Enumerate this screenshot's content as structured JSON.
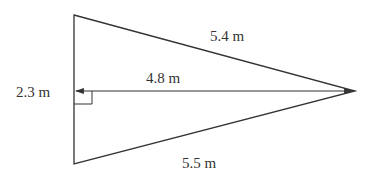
{
  "diagram": {
    "type": "triangle-with-altitude",
    "colors": {
      "line": "#333333",
      "background": "#ffffff"
    },
    "labels": {
      "top_side": "5.4 m",
      "bottom_side": "5.5 m",
      "altitude": "4.8 m",
      "base_segment": "2.3 m"
    }
  }
}
